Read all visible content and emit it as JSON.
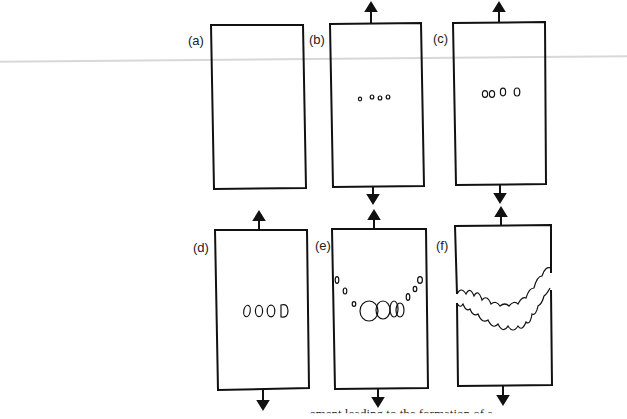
{
  "figure": {
    "panels": [
      {
        "id": "a",
        "label": "(a)",
        "stage": "undeformed specimen",
        "arrows": false
      },
      {
        "id": "b",
        "label": "(b)",
        "stage": "small voids nucleate",
        "arrows": true
      },
      {
        "id": "c",
        "label": "(c)",
        "stage": "voids grow",
        "arrows": true
      },
      {
        "id": "d",
        "label": "(d)",
        "stage": "voids grow larger",
        "arrows": true
      },
      {
        "id": "e",
        "label": "(e)",
        "stage": "voids coalesce, crack forms",
        "arrows": true
      },
      {
        "id": "f",
        "label": "(f)",
        "stage": "crack propagates, fracture",
        "arrows": true
      }
    ],
    "caption_fragment": "...ement leading to the formation of a"
  }
}
